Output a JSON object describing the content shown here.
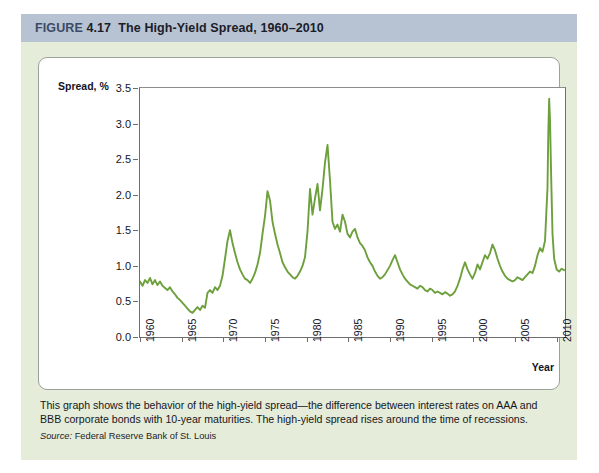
{
  "figure": {
    "label": "FIGURE",
    "number": "4.17",
    "title": "The High-Yield Spread, 1960–2010",
    "caption": "This graph shows the behavior of the high-yield spread—the difference between interest rates on AAA and BBB corporate bonds with 10-year maturities. The high-yield spread rises around the time of recessions.",
    "source_label": "Source:",
    "source_text": "Federal Reserve Bank of St. Louis"
  },
  "colors": {
    "title_bar": "#b7c3d3",
    "page_tint": "#e5ecd9",
    "series_line": "#6da03c",
    "axis": "#6e6e6e",
    "panel": "#ffffff"
  },
  "chart_data": {
    "type": "line",
    "title": "The High-Yield Spread, 1960–2010",
    "xlabel": "Year",
    "ylabel": "Spread, %",
    "xlim": [
      1960,
      2011
    ],
    "ylim": [
      0.0,
      3.5
    ],
    "grid": false,
    "legend": null,
    "y_ticks": [
      "0.0",
      "0.5",
      "1.0",
      "1.5",
      "2.0",
      "2.5",
      "3.0",
      "3.5"
    ],
    "y_tick_values": [
      0.0,
      0.5,
      1.0,
      1.5,
      2.0,
      2.5,
      3.0,
      3.5
    ],
    "x_ticks": [
      "1960",
      "1965",
      "1970",
      "1975",
      "1980",
      "1985",
      "1990",
      "1995",
      "2000",
      "2005",
      "2010"
    ],
    "x_tick_values": [
      1960,
      1965,
      1970,
      1975,
      1980,
      1985,
      1990,
      1995,
      2000,
      2005,
      2010
    ],
    "series": [
      {
        "name": "High-yield spread",
        "color": "#6da03c",
        "x": [
          1960.0,
          1960.3,
          1960.6,
          1960.9,
          1961.2,
          1961.5,
          1961.8,
          1962.1,
          1962.4,
          1962.7,
          1963.0,
          1963.3,
          1963.6,
          1963.9,
          1964.2,
          1964.5,
          1964.8,
          1965.1,
          1965.4,
          1965.7,
          1966.0,
          1966.3,
          1966.6,
          1966.9,
          1967.2,
          1967.5,
          1967.8,
          1968.1,
          1968.4,
          1968.7,
          1969.0,
          1969.3,
          1969.6,
          1969.9,
          1970.2,
          1970.5,
          1970.8,
          1971.1,
          1971.4,
          1971.7,
          1972.0,
          1972.3,
          1972.6,
          1972.9,
          1973.2,
          1973.5,
          1973.8,
          1974.1,
          1974.4,
          1974.7,
          1975.0,
          1975.3,
          1975.6,
          1975.9,
          1976.2,
          1976.5,
          1976.8,
          1977.1,
          1977.4,
          1977.7,
          1978.0,
          1978.3,
          1978.6,
          1978.9,
          1979.2,
          1979.5,
          1979.8,
          1980.1,
          1980.4,
          1980.7,
          1981.0,
          1981.3,
          1981.6,
          1981.9,
          1982.2,
          1982.5,
          1982.8,
          1983.1,
          1983.4,
          1983.7,
          1984.0,
          1984.3,
          1984.6,
          1984.9,
          1985.2,
          1985.5,
          1985.8,
          1986.1,
          1986.4,
          1986.7,
          1987.0,
          1987.3,
          1987.6,
          1987.9,
          1988.2,
          1988.5,
          1988.8,
          1989.1,
          1989.4,
          1989.7,
          1990.0,
          1990.3,
          1990.6,
          1990.9,
          1991.2,
          1991.5,
          1991.8,
          1992.1,
          1992.4,
          1992.7,
          1993.0,
          1993.3,
          1993.6,
          1993.9,
          1994.2,
          1994.5,
          1994.8,
          1995.1,
          1995.4,
          1995.7,
          1996.0,
          1996.3,
          1996.6,
          1996.9,
          1997.2,
          1997.5,
          1997.8,
          1998.1,
          1998.4,
          1998.7,
          1999.0,
          1999.3,
          1999.6,
          1999.9,
          2000.2,
          2000.5,
          2000.8,
          2001.1,
          2001.4,
          2001.7,
          2002.0,
          2002.3,
          2002.6,
          2002.9,
          2003.2,
          2003.5,
          2003.8,
          2004.1,
          2004.4,
          2004.7,
          2005.0,
          2005.3,
          2005.6,
          2005.9,
          2006.2,
          2006.5,
          2006.8,
          2007.1,
          2007.4,
          2007.7,
          2008.0,
          2008.3,
          2008.6,
          2008.9,
          2009.0,
          2009.1,
          2009.2,
          2009.35,
          2009.5,
          2009.7,
          2010.0,
          2010.3,
          2010.6,
          2010.9
        ],
        "y": [
          0.78,
          0.72,
          0.8,
          0.76,
          0.83,
          0.74,
          0.8,
          0.73,
          0.78,
          0.72,
          0.69,
          0.66,
          0.7,
          0.64,
          0.6,
          0.55,
          0.52,
          0.48,
          0.44,
          0.4,
          0.36,
          0.34,
          0.38,
          0.42,
          0.38,
          0.44,
          0.41,
          0.62,
          0.66,
          0.62,
          0.7,
          0.66,
          0.72,
          0.86,
          1.1,
          1.35,
          1.5,
          1.32,
          1.18,
          1.05,
          0.95,
          0.88,
          0.82,
          0.8,
          0.76,
          0.82,
          0.9,
          1.02,
          1.18,
          1.45,
          1.7,
          2.05,
          1.92,
          1.62,
          1.45,
          1.3,
          1.18,
          1.05,
          0.98,
          0.92,
          0.88,
          0.84,
          0.82,
          0.86,
          0.92,
          1.0,
          1.12,
          1.48,
          2.08,
          1.72,
          1.95,
          2.15,
          1.78,
          2.08,
          2.45,
          2.7,
          2.2,
          1.62,
          1.52,
          1.58,
          1.48,
          1.72,
          1.62,
          1.45,
          1.4,
          1.48,
          1.52,
          1.4,
          1.32,
          1.28,
          1.22,
          1.12,
          1.05,
          1.0,
          0.92,
          0.86,
          0.82,
          0.84,
          0.88,
          0.94,
          1.0,
          1.08,
          1.15,
          1.05,
          0.95,
          0.88,
          0.82,
          0.78,
          0.74,
          0.72,
          0.7,
          0.68,
          0.72,
          0.7,
          0.66,
          0.64,
          0.68,
          0.66,
          0.62,
          0.64,
          0.62,
          0.6,
          0.63,
          0.61,
          0.58,
          0.6,
          0.64,
          0.72,
          0.82,
          0.95,
          1.05,
          0.95,
          0.88,
          0.82,
          0.9,
          1.02,
          0.95,
          1.05,
          1.15,
          1.1,
          1.18,
          1.3,
          1.22,
          1.1,
          1.0,
          0.92,
          0.86,
          0.82,
          0.8,
          0.78,
          0.8,
          0.84,
          0.82,
          0.8,
          0.84,
          0.88,
          0.92,
          0.9,
          1.0,
          1.15,
          1.25,
          1.2,
          1.35,
          2.1,
          2.9,
          3.35,
          3.05,
          2.2,
          1.45,
          1.1,
          0.95,
          0.92,
          0.96,
          0.94
        ]
      }
    ]
  }
}
